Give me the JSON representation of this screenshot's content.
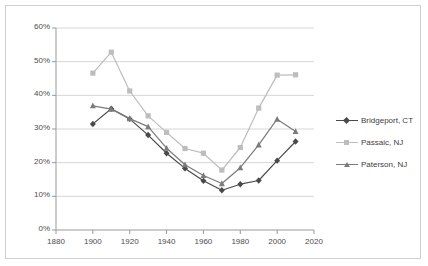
{
  "chart_data": {
    "type": "line",
    "title": "",
    "xlabel": "",
    "ylabel": "",
    "xlim": [
      1880,
      2020
    ],
    "ylim": [
      0,
      60
    ],
    "xticks": [
      "1880",
      "1900",
      "1920",
      "1940",
      "1960",
      "1980",
      "2000",
      "2020"
    ],
    "yticks": [
      "0%",
      "10%",
      "20%",
      "30%",
      "40%",
      "50%",
      "60%"
    ],
    "grid": "horizontal",
    "legend_position": "right",
    "x": [
      1900,
      1910,
      1920,
      1930,
      1940,
      1950,
      1960,
      1970,
      1980,
      1990,
      2000,
      2010
    ],
    "series": [
      {
        "name": "Bridgeport, CT",
        "color": "#4a4a4a",
        "marker": "diamond",
        "values": [
          31.5,
          36.0,
          33.0,
          28.2,
          22.8,
          18.3,
          14.6,
          11.8,
          13.6,
          14.7,
          20.6,
          26.3
        ]
      },
      {
        "name": "Passaic, NJ",
        "color": "#bdbdbd",
        "marker": "square",
        "values": [
          46.6,
          52.8,
          41.3,
          33.9,
          29.0,
          24.2,
          22.8,
          17.8,
          24.5,
          36.2,
          46.0,
          46.1
        ]
      },
      {
        "name": "Paterson, NJ",
        "color": "#7b7b7b",
        "marker": "triangle",
        "values": [
          36.9,
          35.9,
          33.1,
          30.7,
          24.3,
          19.4,
          16.2,
          13.8,
          18.5,
          25.3,
          32.9,
          29.3
        ]
      }
    ]
  },
  "legend": {
    "items": [
      {
        "label": "Bridgeport, CT"
      },
      {
        "label": "Passaic, NJ"
      },
      {
        "label": "Paterson, NJ"
      }
    ]
  }
}
